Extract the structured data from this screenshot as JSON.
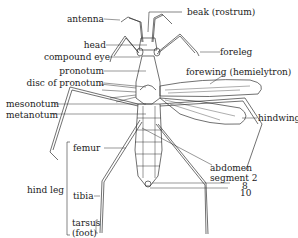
{
  "diagram": {
    "labels": {
      "antenna": "antenna",
      "head": "head",
      "compound_eye": "compound eye",
      "pronotum": "pronotum",
      "disc_of_pronotum": "disc of pronotum",
      "mesonotum": "mesonotum",
      "metanotum": "metanotum",
      "beak": "beak (rostrum)",
      "foreleg": "foreleg",
      "forewing": "forewing (hemielytron)",
      "hindwing": "hindwing",
      "hind_leg": "hind leg",
      "femur": "femur",
      "tibia": "tibia",
      "tarsus": "tarsus",
      "foot": "(foot)",
      "abdomen": "abdomen",
      "segment": "segment 2",
      "segment_8": "8",
      "segment_10": "10"
    },
    "colors": {
      "line": "#333333",
      "background": "#ffffff"
    }
  }
}
